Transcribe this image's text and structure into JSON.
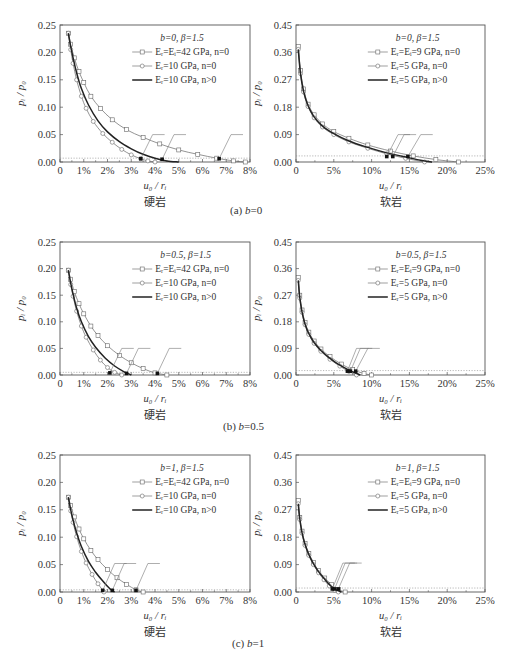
{
  "figure": {
    "rows": [
      {
        "caption_prefix": "(a) ",
        "caption_var": "b",
        "caption_value": "=0",
        "caption_y": 210
      },
      {
        "caption_prefix": "(b) ",
        "caption_var": "b",
        "caption_value": "=0.5",
        "caption_y": 425
      },
      {
        "caption_prefix": "(c) ",
        "caption_var": "b",
        "caption_value": "=1",
        "caption_y": 640
      }
    ],
    "rock_labels": {
      "hard": "硬岩",
      "soft": "软岩"
    },
    "xlabel": "u₀ / rᵢ",
    "ylabel": "pᵢ / p₀",
    "marker_style": {
      "series1": "square-open",
      "series2": "circle-open",
      "series3": "solid-thick"
    },
    "colors": {
      "line": "#444444",
      "frame": "#555555",
      "dotted": "#888888",
      "marker_fill": "#ffffff",
      "point": "#111111"
    }
  },
  "chart_data": [
    {
      "id": "a-hard",
      "type": "line",
      "title": "",
      "row": "(a) b=0",
      "panel_label": "硬岩",
      "xlabel": "u0/ri",
      "ylabel": "pi/p0",
      "xlim": [
        0,
        8
      ],
      "ylim": [
        0,
        0.25
      ],
      "xticks": [
        "0",
        "1%",
        "2%",
        "3%",
        "4%",
        "5%",
        "6%",
        "7%",
        "8%"
      ],
      "yticks": [
        "0.00",
        "0.05",
        "0.10",
        "0.15",
        "0.20",
        "0.25"
      ],
      "legend_title": "b=0, β=1.5",
      "legend": [
        "Eᵣ=Eᵢ=42 GPa, n=0",
        "Eᵣ=10 GPa, n=0",
        "Eᵣ=10 GPa, n>0"
      ],
      "series": [
        {
          "name": "Er=Ei=42 GPa, n=0",
          "x": [
            0.35,
            0.45,
            0.6,
            0.8,
            1.0,
            1.3,
            1.7,
            2.2,
            2.8,
            3.5,
            4.2,
            5.0,
            5.8,
            6.6,
            7.3,
            7.8
          ],
          "y": [
            0.235,
            0.215,
            0.19,
            0.165,
            0.145,
            0.12,
            0.098,
            0.077,
            0.059,
            0.045,
            0.033,
            0.022,
            0.014,
            0.007,
            0.002,
            0.0
          ]
        },
        {
          "name": "Er=10 GPa, n=0",
          "x": [
            0.35,
            0.45,
            0.55,
            0.7,
            0.9,
            1.1,
            1.4,
            1.8,
            2.2,
            2.6,
            3.0,
            3.4,
            3.7,
            4.0
          ],
          "y": [
            0.235,
            0.205,
            0.18,
            0.15,
            0.12,
            0.098,
            0.074,
            0.052,
            0.036,
            0.023,
            0.013,
            0.006,
            0.002,
            0.0
          ]
        },
        {
          "name": "Er=10 GPa, n>0",
          "x": [
            0.35,
            0.5,
            0.7,
            0.9,
            1.2,
            1.6,
            2.0,
            2.5,
            3.0,
            3.5,
            4.0,
            4.5,
            5.0
          ],
          "y": [
            0.235,
            0.2,
            0.163,
            0.134,
            0.104,
            0.075,
            0.055,
            0.037,
            0.024,
            0.014,
            0.007,
            0.002,
            0.0
          ]
        }
      ],
      "dotted_y": 0.007,
      "annotations": [
        {
          "point": [
            3.4,
            0.006
          ],
          "label_end": [
            3.9,
            0.05
          ]
        },
        {
          "point": [
            4.3,
            0.005
          ],
          "label_end": [
            4.8,
            0.05
          ]
        },
        {
          "point": [
            6.7,
            0.006
          ],
          "label_end": [
            7.2,
            0.05
          ]
        }
      ]
    },
    {
      "id": "a-soft",
      "type": "line",
      "row": "(a) b=0",
      "panel_label": "软岩",
      "xlabel": "u0/ri",
      "ylabel": "pi/p0",
      "xlim": [
        0,
        25
      ],
      "ylim": [
        0,
        0.45
      ],
      "xticks": [
        "0",
        "5%",
        "10%",
        "15%",
        "20%",
        "25%"
      ],
      "yticks": [
        "0.00",
        "0.09",
        "0.18",
        "0.27",
        "0.36",
        "0.45"
      ],
      "legend_title": "b=0, β=1.5",
      "legend": [
        "Eᵣ=Eᵢ=9 GPa, n=0",
        "Eᵣ=5 GPa, n=0",
        "Eᵣ=5 GPa, n>0"
      ],
      "series": [
        {
          "name": "Er=Ei=9 GPa, n=0",
          "x": [
            0.3,
            0.6,
            1.0,
            1.6,
            2.4,
            3.5,
            5.0,
            7.0,
            9.5,
            12.5,
            15.5,
            18.5,
            21.5
          ],
          "y": [
            0.38,
            0.3,
            0.24,
            0.19,
            0.155,
            0.125,
            0.1,
            0.078,
            0.056,
            0.036,
            0.02,
            0.008,
            0.0
          ]
        },
        {
          "name": "Er=5 GPa, n=0",
          "x": [
            0.3,
            0.6,
            1.0,
            1.6,
            2.4,
            3.5,
            5.0,
            7.0,
            9.5,
            12.0,
            14.5,
            17.0
          ],
          "y": [
            0.37,
            0.29,
            0.23,
            0.182,
            0.145,
            0.115,
            0.09,
            0.066,
            0.045,
            0.027,
            0.012,
            0.0
          ]
        },
        {
          "name": "Er=5 GPa, n>0",
          "x": [
            0.3,
            0.6,
            1.0,
            1.6,
            2.4,
            3.5,
            5.0,
            7.0,
            9.5,
            12.0,
            14.5,
            16.5,
            18.0
          ],
          "y": [
            0.37,
            0.29,
            0.232,
            0.185,
            0.148,
            0.118,
            0.093,
            0.069,
            0.048,
            0.03,
            0.016,
            0.006,
            0.0
          ]
        }
      ],
      "dotted_y": 0.02,
      "annotations": [
        {
          "point": [
            12.0,
            0.018
          ],
          "label_end": [
            13.5,
            0.09
          ]
        },
        {
          "point": [
            12.8,
            0.018
          ],
          "label_end": [
            14.3,
            0.09
          ]
        },
        {
          "point": [
            14.8,
            0.018
          ],
          "label_end": [
            16.5,
            0.09
          ]
        }
      ]
    },
    {
      "id": "b-hard",
      "type": "line",
      "row": "(b) b=0.5",
      "panel_label": "硬岩",
      "xlabel": "u0/ri",
      "ylabel": "pi/p0",
      "xlim": [
        0,
        8
      ],
      "ylim": [
        0,
        0.25
      ],
      "xticks": [
        "0",
        "1%",
        "2%",
        "3%",
        "4%",
        "5%",
        "6%",
        "7%",
        "8%"
      ],
      "yticks": [
        "0.00",
        "0.05",
        "0.10",
        "0.15",
        "0.20",
        "0.25"
      ],
      "legend_title": "b=0.5, β=1.5",
      "legend": [
        "Eᵣ=Eᵢ=42 GPa, n=0",
        "Eᵣ=10 GPa, n=0",
        "Eᵣ=10 GPa, n>0"
      ],
      "series": [
        {
          "name": "Er=Ei=42 GPa, n=0",
          "x": [
            0.35,
            0.45,
            0.6,
            0.8,
            1.0,
            1.3,
            1.6,
            2.0,
            2.5,
            3.0,
            3.5,
            4.0,
            4.5
          ],
          "y": [
            0.197,
            0.18,
            0.157,
            0.134,
            0.115,
            0.092,
            0.074,
            0.055,
            0.037,
            0.023,
            0.012,
            0.004,
            0.0
          ]
        },
        {
          "name": "Er=10 GPa, n=0",
          "x": [
            0.35,
            0.45,
            0.55,
            0.7,
            0.9,
            1.1,
            1.4,
            1.7,
            2.0,
            2.3,
            2.6
          ],
          "y": [
            0.197,
            0.17,
            0.148,
            0.12,
            0.092,
            0.071,
            0.047,
            0.028,
            0.014,
            0.005,
            0.0
          ]
        },
        {
          "name": "Er=10 GPa, n>0",
          "x": [
            0.35,
            0.5,
            0.7,
            0.9,
            1.2,
            1.5,
            1.9,
            2.3,
            2.7,
            3.0
          ],
          "y": [
            0.197,
            0.162,
            0.126,
            0.1,
            0.072,
            0.052,
            0.032,
            0.017,
            0.006,
            0.0
          ]
        }
      ],
      "dotted_y": 0.005,
      "annotations": [
        {
          "point": [
            2.1,
            0.004
          ],
          "label_end": [
            2.6,
            0.05
          ]
        },
        {
          "point": [
            2.8,
            0.003
          ],
          "label_end": [
            3.3,
            0.05
          ]
        },
        {
          "point": [
            4.1,
            0.003
          ],
          "label_end": [
            4.6,
            0.05
          ]
        }
      ]
    },
    {
      "id": "b-soft",
      "type": "line",
      "row": "(b) b=0.5",
      "panel_label": "软岩",
      "xlabel": "u0/ri",
      "ylabel": "pi/p0",
      "xlim": [
        0,
        25
      ],
      "ylim": [
        0,
        0.45
      ],
      "xticks": [
        "0",
        "5%",
        "10%",
        "15%",
        "20%",
        "25%"
      ],
      "yticks": [
        "0.00",
        "0.09",
        "0.18",
        "0.27",
        "0.36",
        "0.45"
      ],
      "legend_title": "b=0.5, β=1.5",
      "legend": [
        "Eᵣ=Eᵢ=9 GPa, n=0",
        "Eᵣ=5 GPa, n=0",
        "Eᵣ=5 GPa, n>0"
      ],
      "series": [
        {
          "name": "Er=Ei=9 GPa, n=0",
          "x": [
            0.3,
            0.5,
            0.8,
            1.2,
            1.7,
            2.4,
            3.3,
            4.5,
            6.0,
            7.5,
            9.0,
            10.0
          ],
          "y": [
            0.33,
            0.27,
            0.22,
            0.178,
            0.145,
            0.115,
            0.088,
            0.062,
            0.037,
            0.018,
            0.005,
            0.0
          ]
        },
        {
          "name": "Er=5 GPa, n=0",
          "x": [
            0.3,
            0.5,
            0.8,
            1.2,
            1.7,
            2.4,
            3.3,
            4.5,
            5.8,
            7.0,
            8.0
          ],
          "y": [
            0.32,
            0.26,
            0.212,
            0.17,
            0.137,
            0.107,
            0.08,
            0.053,
            0.03,
            0.012,
            0.0
          ]
        },
        {
          "name": "Er=5 GPa, n>0",
          "x": [
            0.3,
            0.5,
            0.8,
            1.2,
            1.7,
            2.4,
            3.3,
            4.5,
            5.8,
            7.2,
            8.5
          ],
          "y": [
            0.32,
            0.262,
            0.214,
            0.172,
            0.14,
            0.11,
            0.083,
            0.056,
            0.033,
            0.014,
            0.0
          ]
        }
      ],
      "dotted_y": 0.015,
      "annotations": [
        {
          "point": [
            6.8,
            0.013
          ],
          "label_end": [
            8.0,
            0.09
          ]
        },
        {
          "point": [
            7.2,
            0.013
          ],
          "label_end": [
            8.5,
            0.09
          ]
        },
        {
          "point": [
            7.9,
            0.013
          ],
          "label_end": [
            9.5,
            0.09
          ]
        }
      ]
    },
    {
      "id": "c-hard",
      "type": "line",
      "row": "(c) b=1",
      "panel_label": "硬岩",
      "xlabel": "u0/ri",
      "ylabel": "pi/p0",
      "xlim": [
        0,
        8
      ],
      "ylim": [
        0,
        0.25
      ],
      "xticks": [
        "0",
        "1%",
        "2%",
        "3%",
        "4%",
        "5%",
        "6%",
        "7%",
        "8%"
      ],
      "yticks": [
        "0.00",
        "0.05",
        "0.10",
        "0.15",
        "0.20",
        "0.25"
      ],
      "legend_title": "b=1, β=1.5",
      "legend": [
        "Eᵣ=Eᵢ=42 GPa, n=0",
        "Eᵣ=10 GPa, n=0",
        "Eᵣ=10 GPa, n>0"
      ],
      "series": [
        {
          "name": "Er=Ei=42 GPa, n=0",
          "x": [
            0.35,
            0.45,
            0.6,
            0.8,
            1.0,
            1.3,
            1.6,
            2.0,
            2.4,
            2.8,
            3.2,
            3.5
          ],
          "y": [
            0.173,
            0.158,
            0.137,
            0.115,
            0.097,
            0.076,
            0.059,
            0.041,
            0.026,
            0.014,
            0.004,
            0.0
          ]
        },
        {
          "name": "Er=10 GPa, n=0",
          "x": [
            0.35,
            0.45,
            0.55,
            0.7,
            0.9,
            1.1,
            1.35,
            1.6,
            1.85
          ],
          "y": [
            0.173,
            0.148,
            0.127,
            0.101,
            0.074,
            0.053,
            0.032,
            0.015,
            0.0
          ]
        },
        {
          "name": "Er=10 GPa, n>0",
          "x": [
            0.35,
            0.5,
            0.7,
            0.9,
            1.2,
            1.5,
            1.8,
            2.1,
            2.3
          ],
          "y": [
            0.173,
            0.14,
            0.108,
            0.083,
            0.056,
            0.036,
            0.02,
            0.006,
            0.0
          ]
        }
      ],
      "dotted_y": 0.004,
      "annotations": [
        {
          "point": [
            1.8,
            0.003
          ],
          "label_end": [
            2.3,
            0.052
          ]
        },
        {
          "point": [
            2.2,
            0.003
          ],
          "label_end": [
            2.7,
            0.052
          ]
        },
        {
          "point": [
            3.2,
            0.003
          ],
          "label_end": [
            3.7,
            0.052
          ]
        }
      ]
    },
    {
      "id": "c-soft",
      "type": "line",
      "row": "(c) b=1",
      "panel_label": "软岩",
      "xlabel": "u0/ri",
      "ylabel": "pi/p0",
      "xlim": [
        0,
        25
      ],
      "ylim": [
        0,
        0.45
      ],
      "xticks": [
        "0",
        "5%",
        "10%",
        "15%",
        "20%",
        "25%"
      ],
      "yticks": [
        "0.00",
        "0.09",
        "0.18",
        "0.27",
        "0.36",
        "0.45"
      ],
      "legend_title": "b=1, β=1.5",
      "legend": [
        "Eᵣ=Eᵢ=9 GPa, n=0",
        "Eᵣ=5 GPa, n=0",
        "Eᵣ=5 GPa, n>0"
      ],
      "series": [
        {
          "name": "Er=Ei=9 GPa, n=0",
          "x": [
            0.3,
            0.5,
            0.8,
            1.2,
            1.7,
            2.3,
            3.0,
            3.8,
            4.7,
            5.6,
            6.5
          ],
          "y": [
            0.3,
            0.245,
            0.2,
            0.16,
            0.127,
            0.097,
            0.07,
            0.046,
            0.024,
            0.008,
            0.0
          ]
        },
        {
          "name": "Er=5 GPa, n=0",
          "x": [
            0.3,
            0.5,
            0.8,
            1.2,
            1.7,
            2.3,
            3.0,
            3.7,
            4.4,
            5.1,
            5.6
          ],
          "y": [
            0.29,
            0.238,
            0.193,
            0.153,
            0.12,
            0.09,
            0.063,
            0.04,
            0.02,
            0.006,
            0.0
          ]
        },
        {
          "name": "Er=5 GPa, n>0",
          "x": [
            0.3,
            0.5,
            0.8,
            1.2,
            1.7,
            2.3,
            3.0,
            3.8,
            4.5,
            5.3,
            6.0
          ],
          "y": [
            0.29,
            0.24,
            0.195,
            0.156,
            0.123,
            0.093,
            0.066,
            0.042,
            0.022,
            0.007,
            0.0
          ]
        }
      ],
      "dotted_y": 0.013,
      "annotations": [
        {
          "point": [
            4.8,
            0.01
          ],
          "label_end": [
            6.2,
            0.095
          ]
        },
        {
          "point": [
            5.1,
            0.01
          ],
          "label_end": [
            6.5,
            0.095
          ]
        },
        {
          "point": [
            5.6,
            0.01
          ],
          "label_end": [
            7.1,
            0.095
          ]
        }
      ]
    }
  ]
}
